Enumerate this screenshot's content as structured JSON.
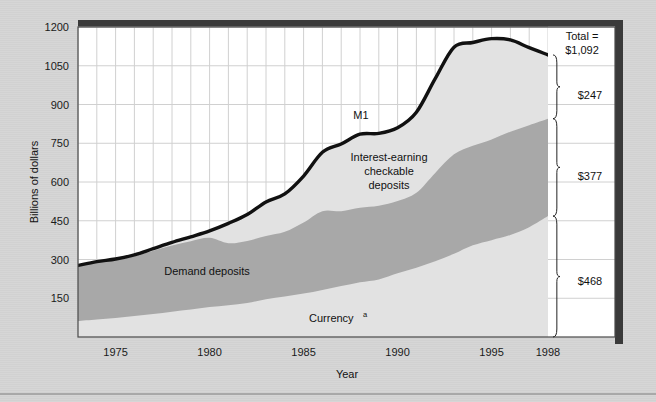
{
  "figure": {
    "background_color": "#d5d5d5",
    "frame_shadow_color": "#333333",
    "bottom_rule_color": "#9a9a9a"
  },
  "axes": {
    "y_axis_title": "Billions of dollars",
    "x_axis_title": "Year",
    "y_ticks": [
      "150",
      "300",
      "450",
      "600",
      "750",
      "900",
      "1050",
      "1200"
    ],
    "x_ticks": [
      "1975",
      "1980",
      "1985",
      "1990",
      "1995",
      "1998"
    ]
  },
  "series_labels": {
    "m1": "M1",
    "interest_earning": "Interest-earning\ncheckable\ndeposits",
    "interest_earning_line1": "Interest-earning",
    "interest_earning_line2": "checkable",
    "interest_earning_line3": "deposits",
    "demand_deposits": "Demand deposits",
    "currency": "Currency",
    "currency_superscript": "a"
  },
  "callouts": {
    "total_line1": "Total =",
    "total_line2": "$1,092",
    "bracket_interest_earning": "$247",
    "bracket_demand_deposits": "$377",
    "bracket_currency": "$468"
  },
  "colors": {
    "currency_band": "#e2e2e2",
    "demand_deposits_band": "#a8a8a8",
    "interest_earning_band": "#e2e2e2",
    "m1_line": "#111111",
    "grid": "#cfcfcf",
    "plot_background": "#ffffff"
  },
  "chart_data": {
    "type": "area",
    "title": "",
    "subtitle": "",
    "xlabel": "Year",
    "ylabel": "Billions of dollars",
    "xlim": [
      1973,
      1998
    ],
    "ylim": [
      0,
      1200
    ],
    "y_tick_values": [
      150,
      300,
      450,
      600,
      750,
      900,
      1050,
      1200
    ],
    "x_tick_values": [
      1975,
      1980,
      1985,
      1990,
      1995,
      1998
    ],
    "grid": true,
    "legend": "inline-annotations",
    "stacked": true,
    "x": [
      1973,
      1974,
      1975,
      1976,
      1977,
      1978,
      1979,
      1980,
      1981,
      1982,
      1983,
      1984,
      1985,
      1986,
      1987,
      1988,
      1989,
      1990,
      1991,
      1992,
      1993,
      1994,
      1995,
      1996,
      1997,
      1998
    ],
    "series": [
      {
        "name": "Currency",
        "values": [
          62,
          68,
          74,
          81,
          89,
          98,
          106,
          116,
          123,
          132,
          146,
          157,
          168,
          182,
          197,
          212,
          223,
          247,
          268,
          293,
          322,
          355,
          375,
          395,
          425,
          468
        ]
      },
      {
        "name": "Demand deposits",
        "values": [
          215,
          222,
          225,
          232,
          245,
          256,
          265,
          268,
          240,
          240,
          245,
          250,
          275,
          305,
          290,
          288,
          285,
          279,
          290,
          342,
          385,
          385,
          390,
          400,
          395,
          377
        ]
      },
      {
        "name": "Interest-earning checkable deposits",
        "values": [
          0,
          2,
          3,
          5,
          8,
          12,
          17,
          27,
          77,
          102,
          132,
          147,
          180,
          228,
          260,
          285,
          280,
          284,
          312,
          365,
          415,
          400,
          390,
          355,
          300,
          247
        ]
      }
    ],
    "total_line": {
      "name": "M1",
      "values": [
        277,
        292,
        302,
        318,
        342,
        366,
        388,
        411,
        440,
        474,
        523,
        554,
        623,
        715,
        747,
        785,
        788,
        810,
        870,
        1000,
        1122,
        1140,
        1155,
        1150,
        1120,
        1092
      ]
    },
    "annotations": [
      {
        "text": "M1",
        "x": 1988,
        "y": 860
      },
      {
        "text": "Interest-earning checkable deposits",
        "x": 1989,
        "y": 650
      },
      {
        "text": "Demand deposits",
        "x": 1981,
        "y": 255
      },
      {
        "text": "Currency",
        "x": 1987,
        "y": 75
      },
      {
        "text": "Total = $1,092",
        "x": 1999,
        "y": 1180
      },
      {
        "text": "$247",
        "x": 1999,
        "y": 970
      },
      {
        "text": "$377",
        "x": 1999,
        "y": 660
      },
      {
        "text": "$468",
        "x": 1999,
        "y": 235
      }
    ]
  }
}
